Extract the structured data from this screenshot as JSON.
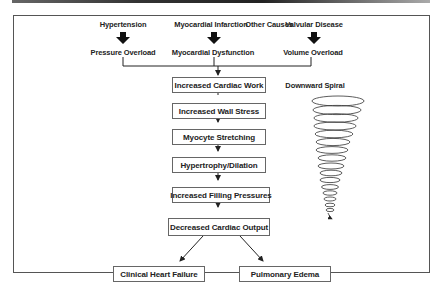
{
  "diagram": {
    "causes": [
      {
        "label": "Hypertension",
        "result": "Pressure Overload"
      },
      {
        "label": "Myocardial Infarction",
        "result": "Myocardial Dysfunction"
      },
      {
        "label": "Other Causes"
      },
      {
        "label": "Valvular Disease",
        "result": "Volume Overload"
      }
    ],
    "chain": [
      "Increased Cardiac Work",
      "Increased Wall Stress",
      "Myocyte Stretching",
      "Hypertrophy/Dilation",
      "Increased Filling Pressures",
      "Decreased Cardiac Output"
    ],
    "outcomes": [
      "Clinical Heart Failure",
      "Pulmonary Edema"
    ],
    "spiral_label": "Downward Spiral"
  }
}
